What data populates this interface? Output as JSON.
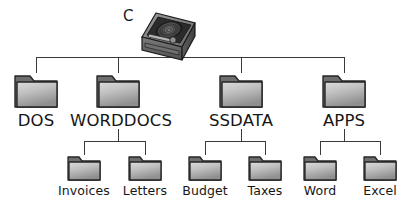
{
  "diagram": {
    "type": "file-system-tree",
    "background_color": "#ffffff",
    "line_color": "#3a3a3a",
    "label_color": "#161616",
    "root": {
      "label": "C",
      "icon": "hard-disk-drive-icon",
      "icon_colors": {
        "case_top": "#8a8a8a",
        "case_front": "#6e6e6e",
        "case_side": "#555555",
        "platter": "#2e2e2e",
        "outline": "#1c1c1c"
      }
    },
    "folder_colors": {
      "tab": "#6e6e6e",
      "body_light": "#d2d2d2",
      "body_dark": "#9a9a9a",
      "outline": "#2b2b2b"
    },
    "level1": [
      {
        "label": "DOS",
        "icon": "folder-icon",
        "x": 36,
        "children": []
      },
      {
        "label": "WORDDOCS",
        "icon": "folder-icon",
        "x": 118,
        "children": [
          "Invoices",
          "Letters"
        ]
      },
      {
        "label": "SSDATA",
        "icon": "folder-icon",
        "x": 241,
        "children": [
          "Budget",
          "Taxes"
        ]
      },
      {
        "label": "APPS",
        "icon": "folder-icon",
        "x": 344,
        "children": [
          "Word",
          "Excel"
        ]
      }
    ],
    "level2": [
      {
        "label": "Invoices",
        "icon": "folder-icon",
        "x": 84,
        "parent": "WORDDOCS"
      },
      {
        "label": "Letters",
        "icon": "folder-icon",
        "x": 145,
        "parent": "WORDDOCS"
      },
      {
        "label": "Budget",
        "icon": "folder-icon",
        "x": 205,
        "parent": "SSDATA"
      },
      {
        "label": "Taxes",
        "icon": "folder-icon",
        "x": 265,
        "parent": "SSDATA"
      },
      {
        "label": "Word",
        "icon": "folder-icon",
        "x": 320,
        "parent": "APPS"
      },
      {
        "label": "Excel",
        "icon": "folder-icon",
        "x": 380,
        "parent": "APPS"
      }
    ]
  }
}
